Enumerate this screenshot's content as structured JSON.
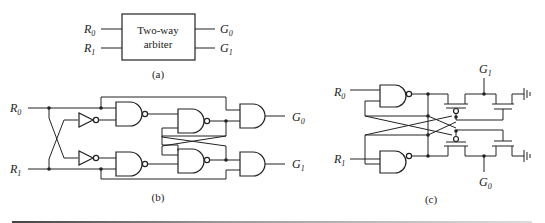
{
  "figure_a": {
    "box_label_line1": "Two-way",
    "box_label_line2": "arbiter",
    "inputs": [
      "R",
      "R"
    ],
    "input_subs": [
      "0",
      "1"
    ],
    "outputs": [
      "G",
      "G"
    ],
    "output_subs": [
      "0",
      "1"
    ],
    "caption": "(a)"
  },
  "figure_b": {
    "inputs": [
      "R",
      "R"
    ],
    "input_subs": [
      "0",
      "1"
    ],
    "outputs": [
      "G",
      "G"
    ],
    "output_subs": [
      "0",
      "1"
    ],
    "caption": "(b)"
  },
  "figure_c": {
    "inputs": [
      "R",
      "R"
    ],
    "input_subs": [
      "0",
      "1"
    ],
    "outputs": [
      "G",
      "G"
    ],
    "output_subs": [
      "1",
      "0"
    ],
    "caption": "(c)"
  }
}
